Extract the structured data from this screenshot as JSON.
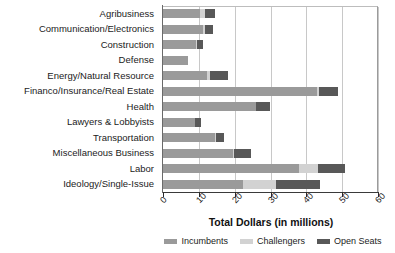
{
  "chart_data": {
    "type": "bar",
    "orientation": "horizontal",
    "stacked": true,
    "title": "",
    "xlabel": "Total Dollars (in millions)",
    "ylabel": "",
    "xlim": [
      0,
      60
    ],
    "xticks": [
      0,
      10,
      20,
      30,
      40,
      50,
      60
    ],
    "xtick_labels": [
      "0",
      "10",
      "20",
      "30",
      "40",
      "50",
      "60"
    ],
    "grid": true,
    "grid_axis": "x",
    "legend_position": "bottom",
    "categories": [
      "Agribusiness",
      "Communication/Electronics",
      "Construction",
      "Defense",
      "Energy/Natural Resource",
      "Financo/Insurance/Real Estate",
      "Health",
      "Lawyers & Lobbyists",
      "Transportation",
      "Miscellaneous Business",
      "Labor",
      "Ideology/Single-Issue"
    ],
    "series": [
      {
        "name": "Incumbents",
        "color": "#9a9a9a",
        "values": [
          10.3,
          11.3,
          9.2,
          7.0,
          12.3,
          43.0,
          25.9,
          8.9,
          14.5,
          19.5,
          38.0,
          22.3
        ]
      },
      {
        "name": "Challengers",
        "color": "#d2d2d2",
        "values": [
          1.3,
          0.4,
          0.2,
          0.0,
          0.7,
          0.4,
          0.1,
          0.1,
          0.2,
          0.3,
          5.2,
          9.2
        ]
      },
      {
        "name": "Open Seats",
        "color": "#585858",
        "values": [
          3.0,
          2.3,
          1.7,
          0.0,
          5.2,
          5.4,
          3.9,
          1.5,
          2.3,
          4.7,
          7.6,
          12.3
        ]
      }
    ]
  },
  "legend": {
    "items": [
      {
        "label": "Incumbents",
        "color": "#9a9a9a"
      },
      {
        "label": "Challengers",
        "color": "#d2d2d2"
      },
      {
        "label": "Open Seats",
        "color": "#585858"
      }
    ]
  }
}
